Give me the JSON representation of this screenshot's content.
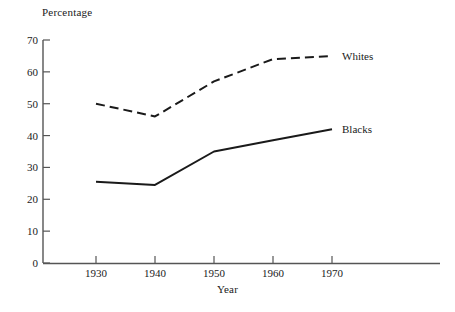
{
  "chart_data": {
    "type": "line",
    "title": "",
    "ylabel": "Percentage",
    "xlabel": "Year",
    "categories": [
      "1930",
      "1940",
      "1950",
      "1960",
      "1970"
    ],
    "x": [
      1930,
      1940,
      1950,
      1960,
      1970
    ],
    "xlim": [
      1925,
      1980
    ],
    "ylim": [
      0,
      70
    ],
    "yticks": [
      "0",
      "10",
      "20",
      "30",
      "40",
      "50",
      "60",
      "70"
    ],
    "ytick_values": [
      0,
      10,
      20,
      30,
      40,
      50,
      60,
      70
    ],
    "grid": false,
    "legend_position": "inline-right-of-line-ends",
    "series": [
      {
        "name": "Whites",
        "style": "dashed",
        "color": "#1a1a1a",
        "values": [
          50,
          46,
          57,
          64,
          65
        ],
        "label": "Whites"
      },
      {
        "name": "Blacks",
        "style": "solid",
        "color": "#1a1a1a",
        "values": [
          25.5,
          24.5,
          35,
          38.5,
          42
        ],
        "label": "Blacks"
      }
    ]
  },
  "colors": {
    "ink": "#1a1a1a",
    "axis": "#555555",
    "background": "#ffffff"
  }
}
